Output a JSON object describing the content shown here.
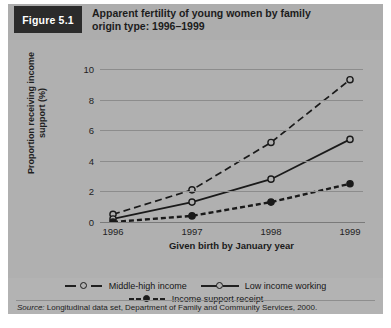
{
  "figure": {
    "number_label": "Figure 5.1",
    "title": "Apparent fertility of young women by family\norigin type: 1996–1999",
    "source_prefix": "Source:",
    "source_text": " Longitudinal data set, Department of Family and Community Services, 2000."
  },
  "chart_data": {
    "type": "line",
    "title": "Apparent fertility of young women by family origin type: 1996–1999",
    "xlabel": "Given birth by January year",
    "ylabel": "Proportion receiving income\nsupport (%)",
    "categories": [
      "1996",
      "1997",
      "1998",
      "1999"
    ],
    "x_tick_labels": [
      "1996",
      "1997",
      "1998",
      "1999"
    ],
    "y_tick_labels": [
      "0",
      "2",
      "4",
      "6",
      "8",
      "10"
    ],
    "y_ticks": [
      0,
      2,
      4,
      6,
      8,
      10
    ],
    "ylim": [
      0,
      10
    ],
    "grid": true,
    "legend_position": "bottom",
    "series": [
      {
        "name": "Middle-high income",
        "style": "dashed",
        "marker": "open-circle",
        "values": [
          0.5,
          2.1,
          5.2,
          9.3
        ]
      },
      {
        "name": "Low income working",
        "style": "solid",
        "marker": "open-circle",
        "values": [
          0.2,
          1.3,
          2.8,
          5.4
        ]
      },
      {
        "name": "Income support receipt",
        "style": "heavy-dashed",
        "marker": "filled-circle",
        "values": [
          0.0,
          0.4,
          1.3,
          2.5
        ]
      }
    ]
  },
  "colors": {
    "panel_background": "#b0b0b0",
    "header_background": "#adadad",
    "figure_box": "#2b2b2b",
    "line": "#1a1a1a",
    "gridline": "#8c8c8c"
  }
}
